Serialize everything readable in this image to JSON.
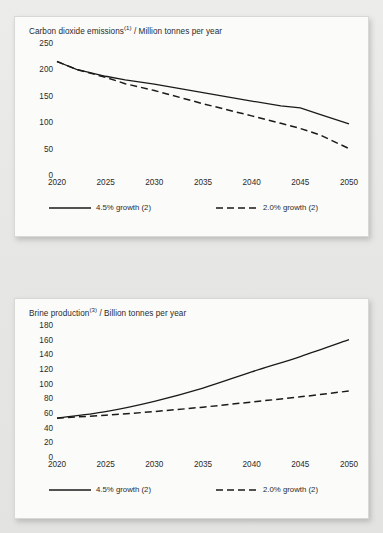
{
  "page": {
    "background_color": "#e9e9e7",
    "panel_color": "#fbfbfa",
    "line_color": "#1a1a1a"
  },
  "charts": [
    {
      "id": "co2-emissions",
      "title_main": "Carbon dioxide emissions",
      "title_note": "(1)",
      "title_unit": "/ Million tonnes per year",
      "yticks": [
        "250",
        "200",
        "150",
        "100",
        "50",
        "0"
      ],
      "xticks": [
        "2020",
        "2025",
        "2030",
        "2035",
        "2040",
        "2045",
        "2050"
      ],
      "legend": [
        {
          "label": "4.5% growth (2)",
          "style": "solid"
        },
        {
          "label": "2.0% growth (2)",
          "style": "dashed"
        }
      ]
    },
    {
      "id": "brine-production",
      "title_main": "Brine production",
      "title_note": "(3)",
      "title_unit": "/ Billion tonnes per year",
      "yticks": [
        "180",
        "160",
        "140",
        "120",
        "100",
        "80",
        "60",
        "40",
        "20",
        "0"
      ],
      "xticks": [
        "2020",
        "2025",
        "2030",
        "2035",
        "2040",
        "2045",
        "2050"
      ],
      "legend": [
        {
          "label": "4.5% growth (2)",
          "style": "solid"
        },
        {
          "label": "2.0% growth (2)",
          "style": "dashed"
        }
      ]
    }
  ],
  "chart_data": [
    {
      "type": "line",
      "title": "Carbon dioxide emissions (1) / Million tonnes per year",
      "xlabel": "",
      "ylabel": "Million tonnes per year",
      "xlim": [
        2020,
        2050
      ],
      "ylim": [
        0,
        250
      ],
      "ytick_values": [
        0,
        50,
        100,
        150,
        200,
        250
      ],
      "xtick_values": [
        2020,
        2025,
        2030,
        2035,
        2040,
        2045,
        2050
      ],
      "grid": false,
      "legend_position": "bottom",
      "x": [
        2020,
        2022,
        2025,
        2027,
        2030,
        2035,
        2040,
        2043,
        2045,
        2047,
        2050
      ],
      "series": [
        {
          "name": "4.5% growth (2)",
          "style": "solid",
          "values": [
            215,
            200,
            187,
            180,
            172,
            156,
            140,
            131,
            127,
            115,
            97
          ]
        },
        {
          "name": "2.0% growth (2)",
          "style": "dashed",
          "values": [
            215,
            200,
            185,
            173,
            160,
            135,
            112,
            98,
            88,
            76,
            50
          ]
        }
      ]
    },
    {
      "type": "line",
      "title": "Brine production (3) / Billion tonnes per year",
      "xlabel": "",
      "ylabel": "Billion tonnes per year",
      "xlim": [
        2020,
        2050
      ],
      "ylim": [
        0,
        180
      ],
      "ytick_values": [
        0,
        20,
        40,
        60,
        80,
        100,
        120,
        140,
        160,
        180
      ],
      "xtick_values": [
        2020,
        2025,
        2030,
        2035,
        2040,
        2045,
        2050
      ],
      "grid": false,
      "legend_position": "bottom",
      "x": [
        2020,
        2025,
        2030,
        2035,
        2040,
        2045,
        2050
      ],
      "series": [
        {
          "name": "4.5% growth (2)",
          "style": "solid",
          "values": [
            53,
            62,
            76,
            94,
            116,
            137,
            160
          ]
        },
        {
          "name": "2.0% growth (2)",
          "style": "dashed",
          "values": [
            53,
            57,
            62,
            68,
            75,
            82,
            90
          ]
        }
      ]
    }
  ]
}
